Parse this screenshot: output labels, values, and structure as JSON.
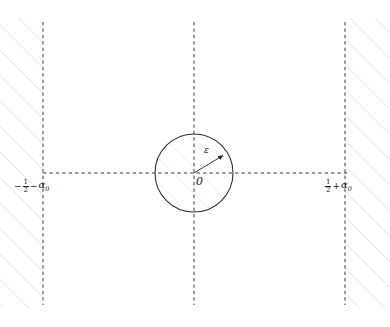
{
  "figure": {
    "kind": "math-diagram",
    "width": 390,
    "height": 327,
    "background_color": "#ffffff",
    "line_color": "#3a3a3a",
    "hatch_color": "#c9c9c9",
    "text_color": "#1a1a1a"
  },
  "labels": {
    "left_boundary": {
      "full_text": "-1/2 - α0",
      "minus_sign": "−",
      "numerator": "1",
      "denominator": "2",
      "operator": "−",
      "symbol": "α",
      "subscript": "0"
    },
    "right_boundary": {
      "full_text": "1/2 + α0",
      "numerator": "1",
      "denominator": "2",
      "operator": "+",
      "symbol": "α",
      "subscript": "0"
    },
    "radius": "ε",
    "origin": "0"
  },
  "geometry": {
    "vertical_lines_x": [
      43,
      194,
      345
    ],
    "vertical_line_top": 22,
    "vertical_line_bottom": 305,
    "horizontal_line_y": 173,
    "horizontal_line_x_start": 43,
    "horizontal_line_x_end": 348,
    "circle": {
      "cx": 194,
      "cy": 173,
      "r": 39
    },
    "radius_arrow": {
      "x1": 194,
      "y1": 173,
      "x2": 225,
      "y2": 154
    }
  }
}
